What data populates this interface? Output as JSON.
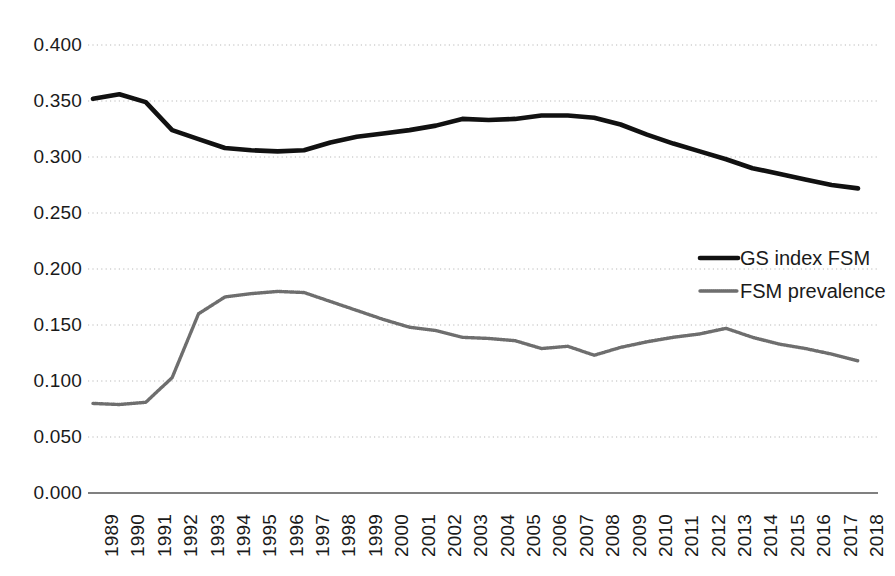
{
  "chart_data": {
    "type": "line",
    "title": "",
    "xlabel": "",
    "ylabel": "",
    "ylim": [
      0.0,
      0.4
    ],
    "ytick_step": 0.05,
    "grid": true,
    "grid_axis": "y",
    "legend_position": "right-middle",
    "ytick_labels": [
      "0.400",
      "0.350",
      "0.300",
      "0.250",
      "0.200",
      "0.150",
      "0.100",
      "0.050",
      "0.000"
    ],
    "ytick_values": [
      0.4,
      0.35,
      0.3,
      0.25,
      0.2,
      0.15,
      0.1,
      0.05,
      0.0
    ],
    "categories": [
      "1989",
      "1990",
      "1991",
      "1992",
      "1993",
      "1994",
      "1995",
      "1996",
      "1997",
      "1998",
      "1999",
      "2000",
      "2001",
      "2002",
      "2003",
      "2004",
      "2005",
      "2006",
      "2007",
      "2008",
      "2009",
      "2010",
      "2011",
      "2012",
      "2013",
      "2014",
      "2015",
      "2016",
      "2017",
      "2018"
    ],
    "series": [
      {
        "name": "GS index FSM",
        "color": "#111111",
        "style": "solid-thick",
        "values": [
          0.352,
          0.356,
          0.349,
          0.324,
          0.316,
          0.308,
          0.306,
          0.305,
          0.306,
          0.313,
          0.318,
          0.321,
          0.324,
          0.328,
          0.334,
          0.333,
          0.334,
          0.337,
          0.337,
          0.335,
          0.329,
          0.32,
          0.312,
          0.305,
          0.298,
          0.29,
          0.285,
          0.28,
          0.275,
          0.272
        ]
      },
      {
        "name": "FSM prevalence",
        "color": "#6e6e6e",
        "style": "dotted-thin",
        "values": [
          0.08,
          0.079,
          0.081,
          0.103,
          0.16,
          0.175,
          0.178,
          0.18,
          0.179,
          0.171,
          0.163,
          0.155,
          0.148,
          0.145,
          0.139,
          0.138,
          0.136,
          0.129,
          0.131,
          0.123,
          0.13,
          0.135,
          0.139,
          0.142,
          0.147,
          0.139,
          0.133,
          0.129,
          0.124,
          0.118
        ]
      }
    ]
  },
  "legend": {
    "items": [
      {
        "label": "GS index FSM"
      },
      {
        "label": "FSM prevalence"
      }
    ]
  }
}
